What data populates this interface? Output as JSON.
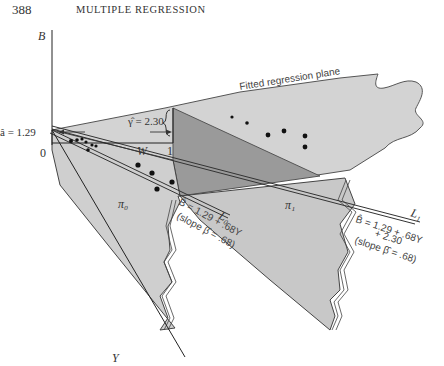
{
  "page": {
    "number": "388",
    "running_head": "MULTIPLE REGRESSION"
  },
  "figure": {
    "axes": {
      "vertical": "B",
      "depth": "Y",
      "horizontal": "W",
      "origin": "0",
      "w_one": "1"
    },
    "plane_label": "Fitted regression plane",
    "intercept_label": "â = 1.29",
    "gamma_label": "γ̂ = 2.30",
    "planes": {
      "pi0": "π₀",
      "pi1": "π₁"
    },
    "lines": {
      "L0": {
        "name": "L₀",
        "equation": "B̂ = 1.29 + .68Y",
        "slope": "(slope β̂ = .68)"
      },
      "L1": {
        "name": "L₁",
        "equation_line1": "B̂ = 1.29 + .68Y",
        "equation_line2": "+ 2.30",
        "slope": "(slope β̂ = .68)"
      }
    }
  }
}
